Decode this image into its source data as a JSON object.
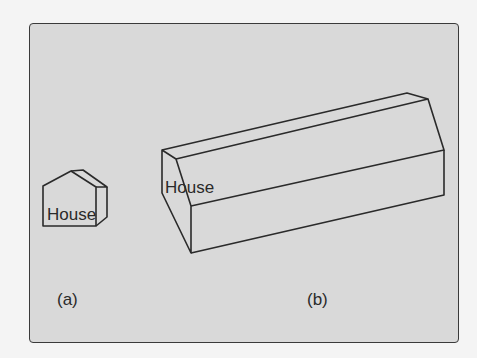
{
  "figure": {
    "panels": [
      {
        "id": "a",
        "caption": "(a)",
        "object_label": "House"
      },
      {
        "id": "b",
        "caption": "(b)",
        "object_label": "House"
      }
    ]
  },
  "colors": {
    "background": "#d9d9d9",
    "stroke": "#2a2a2a",
    "page": "#f4f4f4"
  }
}
